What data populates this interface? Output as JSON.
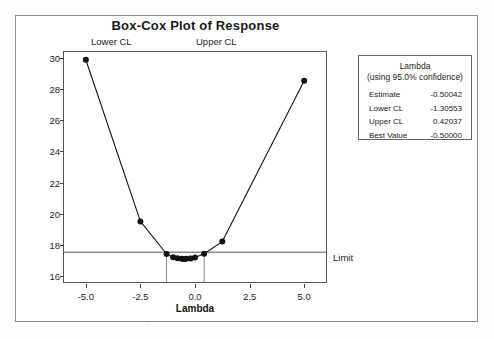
{
  "figure": {
    "title": "Box-Cox Plot of Response",
    "lower_cl_caption": "Lower CL",
    "upper_cl_caption": "Upper CL",
    "limit_label": "Limit"
  },
  "legend": {
    "title_line1": "Lambda",
    "title_line2": "(using 95.0% confidence)",
    "rows": [
      {
        "label": "Estimate",
        "value": "-0.50042"
      },
      {
        "label": "Lower CL",
        "value": "-1.30553"
      },
      {
        "label": "Upper CL",
        "value": "0.42037"
      },
      {
        "label": "Best Value",
        "value": "-0.50000"
      }
    ]
  },
  "chart_data": {
    "type": "line",
    "title": "Box-Cox Plot of Response",
    "xlabel": "Lambda",
    "ylabel": "",
    "xlim": [
      -6.0,
      6.0
    ],
    "ylim": [
      15.6,
      30.4
    ],
    "xticks": [
      "-5.0",
      "-2.5",
      "0.0",
      "2.5",
      "5.0"
    ],
    "xtick_values": [
      -5.0,
      -2.5,
      0.0,
      2.5,
      5.0
    ],
    "yticks": [
      "16",
      "18",
      "20",
      "22",
      "24",
      "26",
      "28",
      "30"
    ],
    "ytick_values": [
      16,
      18,
      20,
      22,
      24,
      26,
      28,
      30
    ],
    "grid": false,
    "legend_position": "outside-right",
    "marker": "filled-circle",
    "line_color": "#111111",
    "series": [
      {
        "name": "StDev vs Lambda",
        "x": [
          -5.0,
          -2.5,
          -1.3,
          -1.0,
          -0.8,
          -0.6,
          -0.5,
          -0.4,
          -0.2,
          0.0,
          0.42,
          1.25,
          5.0
        ],
        "y": [
          29.9,
          19.5,
          17.4,
          17.2,
          17.13,
          17.09,
          17.08,
          17.09,
          17.12,
          17.18,
          17.42,
          18.2,
          28.55
        ]
      }
    ],
    "reference_lines": [
      {
        "name": "limit",
        "orientation": "horizontal",
        "value": 17.52,
        "label": "Limit",
        "color": "#555555"
      },
      {
        "name": "lower-cl",
        "orientation": "vertical",
        "value": -1.30553,
        "label": "Lower CL",
        "color": "#9a9a9a"
      },
      {
        "name": "upper-cl",
        "orientation": "vertical",
        "value": 0.42037,
        "label": "Upper CL",
        "color": "#9a9a9a"
      }
    ]
  }
}
